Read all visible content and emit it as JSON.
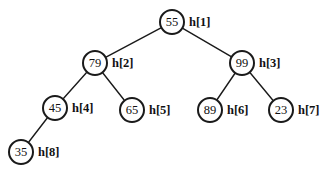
{
  "figure": {
    "kind": "binary-heap-tree-diagram",
    "width": 335,
    "height": 175,
    "background_color": "#ffffff",
    "stroke_color": "#1a1a1a",
    "text_color": "#111111"
  },
  "chart_data": {
    "type": "diagram",
    "title": "",
    "nodes": [
      {
        "id": "n1",
        "key": "55",
        "label": "h[1]",
        "cx": 172,
        "cy": 22,
        "r": 13,
        "level": 0
      },
      {
        "id": "n2",
        "key": "79",
        "label": "h[2]",
        "cx": 95,
        "cy": 63,
        "r": 13,
        "level": 1
      },
      {
        "id": "n3",
        "key": "99",
        "label": "h[3]",
        "cx": 242,
        "cy": 63,
        "r": 13,
        "level": 1
      },
      {
        "id": "n4",
        "key": "45",
        "label": "h[4]",
        "cx": 55,
        "cy": 108,
        "r": 13,
        "level": 2
      },
      {
        "id": "n5",
        "key": "65",
        "label": "h[5]",
        "cx": 132,
        "cy": 110,
        "r": 13,
        "level": 2
      },
      {
        "id": "n6",
        "key": "89",
        "label": "h[6]",
        "cx": 210,
        "cy": 110,
        "r": 13,
        "level": 2
      },
      {
        "id": "n7",
        "key": "23",
        "label": "h[7]",
        "cx": 281,
        "cy": 110,
        "r": 13,
        "level": 2
      },
      {
        "id": "n8",
        "key": "35",
        "label": "h[8]",
        "cx": 21,
        "cy": 152,
        "r": 13,
        "level": 3
      }
    ],
    "edges": [
      {
        "from": "n1",
        "to": "n2"
      },
      {
        "from": "n1",
        "to": "n3"
      },
      {
        "from": "n2",
        "to": "n4"
      },
      {
        "from": "n2",
        "to": "n5"
      },
      {
        "from": "n3",
        "to": "n6"
      },
      {
        "from": "n3",
        "to": "n7"
      },
      {
        "from": "n4",
        "to": "n8"
      }
    ],
    "array_order": [
      "55",
      "79",
      "99",
      "45",
      "65",
      "89",
      "23",
      "35"
    ],
    "index_labels": [
      "h[1]",
      "h[2]",
      "h[3]",
      "h[4]",
      "h[5]",
      "h[6]",
      "h[7]",
      "h[8]"
    ]
  }
}
